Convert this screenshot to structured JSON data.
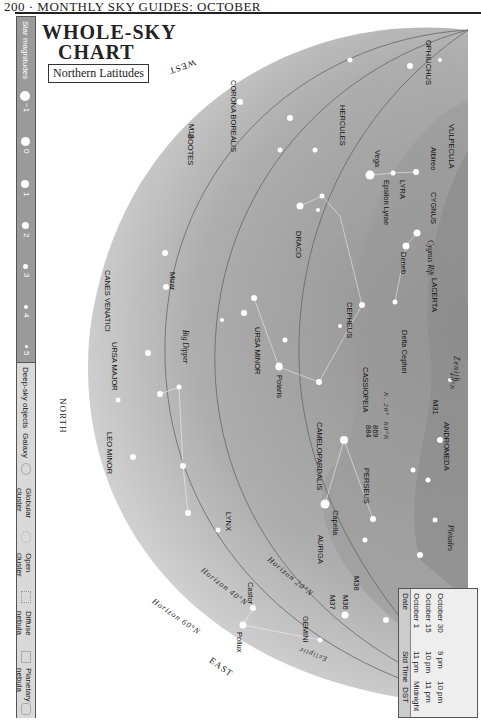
{
  "page_header": "200 · MONTHLY SKY GUIDES: OCTOBER",
  "title": {
    "line1": "Whole-sky",
    "line2": "Chart",
    "subtitle": "Northern Latitudes"
  },
  "legend": {
    "star_magnitudes_label": "Star magnitudes",
    "magnitudes": [
      "−1",
      "0",
      "1",
      "2",
      "3",
      "4",
      "5"
    ],
    "deep_sky_label": "Deep-sky objects",
    "deep_sky_types": [
      "Galaxy",
      "Globular cluster",
      "Open cluster",
      "Diffuse nebula",
      "Planetary nebula"
    ]
  },
  "directions": {
    "west": "WEST",
    "north": "NORTH",
    "east": "EAST"
  },
  "horizon_labels": [
    "Horizon 20°N",
    "Horizon 40°N",
    "Horizon 60°N"
  ],
  "zenith_labels": [
    "Zenith",
    "40°N",
    "60°N",
    "N. 20°"
  ],
  "ecliptic_label": "Ecliptic",
  "constellations": [
    "OPHIUCHUS",
    "VULPECULA",
    "CORONA BOREALIS",
    "HERCULES",
    "LYRA",
    "CYGNUS",
    "BOOTES",
    "DRACO",
    "LACERTA",
    "CEPHEUS",
    "CANES VENATICI",
    "URSA MINOR",
    "CASSIOPEIA",
    "ANDROMEDA",
    "URSA MAJOR",
    "CAMELOPARDALIS",
    "PERSEUS",
    "LEO MINOR",
    "LYNX",
    "AURIGA",
    "TAURUS",
    "GEMINI",
    "ORION"
  ],
  "stars_objects": [
    "M13",
    "Vega",
    "Epsilon Lyrae",
    "Albireo",
    "Cygnus Rift",
    "Deneb",
    "Mizar",
    "Delta Cephei",
    "Polaris",
    "M31",
    "869",
    "884",
    "Big Dipper",
    "Capella",
    "Pleiades",
    "Hyades",
    "Aldebaran",
    "M38",
    "M36",
    "M37",
    "Castor",
    "Pollux",
    "Betelgeuse"
  ],
  "times_table": {
    "headers": [
      "Date",
      "Std Time",
      "DST"
    ],
    "rows": [
      [
        "October 1",
        "11 pm",
        "Midnight"
      ],
      [
        "October 15",
        "10 pm",
        "11 pm"
      ],
      [
        "October 30",
        "9 pm",
        "10 pm"
      ]
    ]
  },
  "colors": {
    "sky_dark": "#8c8c8c",
    "sky_light": "#c8c8c8",
    "milky_way": "#a8a8a8",
    "legend_mag_bg": "#9a9a9a"
  }
}
